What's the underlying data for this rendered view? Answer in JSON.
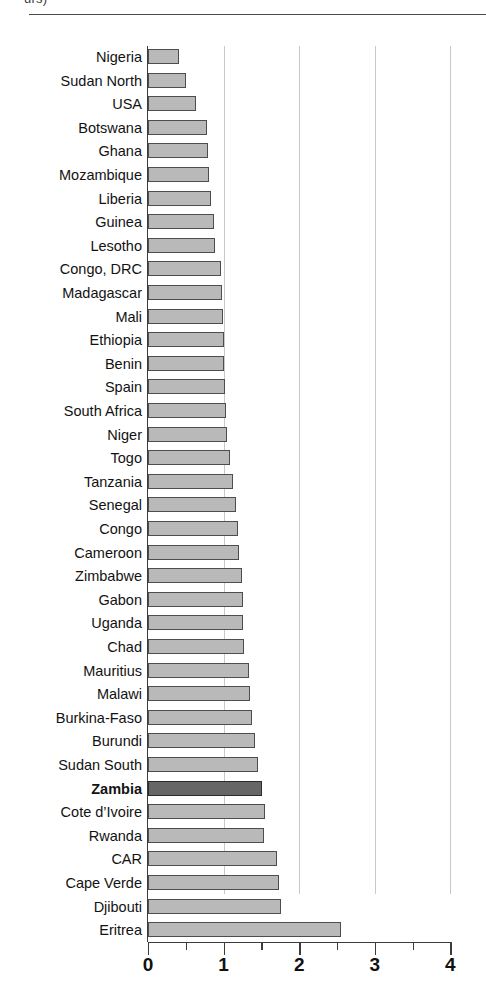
{
  "caption_fragment": "urs)",
  "chart_data": {
    "type": "bar",
    "orientation": "horizontal",
    "title": "",
    "subtitle": "",
    "xlabel": "",
    "ylabel": "",
    "xlim": [
      0,
      4
    ],
    "grid": true,
    "gridline_values": [
      1,
      2,
      3,
      4
    ],
    "legend": [],
    "axis_ticks": {
      "major": [
        0,
        1,
        2,
        3,
        4
      ],
      "major_labels": [
        "0",
        "1",
        "2",
        "3",
        "4"
      ],
      "minor": [
        0.5,
        1.5,
        2.5,
        3.5
      ]
    },
    "highlight_category": "Zambia",
    "colors": {
      "bar_fill": "#b9b9b9",
      "bar_edge": "#4d4d4d",
      "highlight_fill": "#666666",
      "highlight_edge": "#2b2b2b",
      "gridline": "#c9c9c9",
      "axis": "#3c3c3c",
      "text": "#121212"
    },
    "categories": [
      "Nigeria",
      "Sudan North",
      "USA",
      "Botswana",
      "Ghana",
      "Mozambique",
      "Liberia",
      "Guinea",
      "Lesotho",
      "Congo, DRC",
      "Madagascar",
      "Mali",
      "Ethiopia",
      "Benin",
      "Spain",
      "South Africa",
      "Niger",
      "Togo",
      "Tanzania",
      "Senegal",
      "Congo",
      "Cameroon",
      "Zimbabwe",
      "Gabon",
      "Uganda",
      "Chad",
      "Mauritius",
      "Malawi",
      "Burkina-Faso",
      "Burundi",
      "Sudan South",
      "Zambia",
      "Cote d’Ivoire",
      "Rwanda",
      "CAR",
      "Cape Verde",
      "Djibouti",
      "Eritrea"
    ],
    "values": [
      0.41,
      0.5,
      0.64,
      0.78,
      0.8,
      0.81,
      0.83,
      0.87,
      0.89,
      0.97,
      0.98,
      0.99,
      1.0,
      1.0,
      1.02,
      1.03,
      1.05,
      1.08,
      1.13,
      1.16,
      1.19,
      1.21,
      1.24,
      1.25,
      1.26,
      1.27,
      1.34,
      1.35,
      1.38,
      1.41,
      1.45,
      1.51,
      1.55,
      1.54,
      1.7,
      1.73,
      1.76,
      2.55
    ]
  }
}
